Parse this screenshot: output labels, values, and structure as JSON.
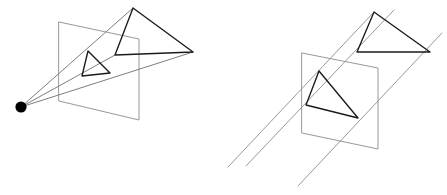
{
  "figure": {
    "width": 447,
    "height": 195,
    "background_color": "#ffffff",
    "title": "",
    "panels": [
      {
        "id": "perspective-projection",
        "name": "perspective-projection-diagram",
        "projection_type": "perspective",
        "description": "Perspective projection: rays converge at a single center of projection shown as a filled black dot, passing through an image plane onto a triangular object.",
        "center_of_projection": {
          "x": 21,
          "y": 107,
          "radius": 5.6,
          "color": "#000000"
        },
        "image_plane": {
          "name": "image-plane",
          "color": "#8c8c8c",
          "stroke_width": 0.9,
          "corners": [
            {
              "x": 59,
              "y": 22
            },
            {
              "x": 139,
              "y": 39
            },
            {
              "x": 139,
              "y": 120
            },
            {
              "x": 59,
              "y": 101
            }
          ]
        },
        "object_triangle": {
          "name": "object-triangle",
          "color": "#1a1a1a",
          "stroke_width": 1.35,
          "vertices": [
            {
              "x": 133,
              "y": 8
            },
            {
              "x": 193,
              "y": 52
            },
            {
              "x": 115,
              "y": 55
            }
          ]
        },
        "image_triangle": {
          "name": "projected-triangle",
          "color": "#1a1a1a",
          "stroke_width": 1.35,
          "vertices": [
            {
              "x": 88,
              "y": 51
            },
            {
              "x": 110,
              "y": 73
            },
            {
              "x": 82,
              "y": 76
            }
          ]
        },
        "projection_rays": {
          "name": "projection-rays",
          "color": "#6e6e6e",
          "stroke_width": 0.9,
          "lines": [
            {
              "x1": 21,
              "y1": 107,
              "x2": 133,
              "y2": 8
            },
            {
              "x1": 21,
              "y1": 107,
              "x2": 193,
              "y2": 52
            },
            {
              "x1": 21,
              "y1": 107,
              "x2": 115,
              "y2": 55
            }
          ]
        }
      },
      {
        "id": "parallel-projection",
        "name": "parallel-projection-diagram",
        "projection_type": "parallel",
        "description": "Parallel (orthographic) projection: rays travel in parallel, with no center of projection, through an image plane onto a triangular object.",
        "center_of_projection": null,
        "image_plane": {
          "name": "image-plane",
          "color": "#8c8c8c",
          "stroke_width": 0.9,
          "corners": [
            {
              "x": 302,
              "y": 53
            },
            {
              "x": 378,
              "y": 68
            },
            {
              "x": 378,
              "y": 149
            },
            {
              "x": 302,
              "y": 133
            }
          ]
        },
        "object_triangle": {
          "name": "object-triangle",
          "color": "#1a1a1a",
          "stroke_width": 1.35,
          "vertices": [
            {
              "x": 374,
              "y": 12
            },
            {
              "x": 430,
              "y": 52
            },
            {
              "x": 357,
              "y": 52
            }
          ]
        },
        "image_triangle": {
          "name": "projected-triangle",
          "color": "#1a1a1a",
          "stroke_width": 1.35,
          "vertices": [
            {
              "x": 319,
              "y": 71
            },
            {
              "x": 358,
              "y": 118
            },
            {
              "x": 306,
              "y": 105
            }
          ]
        },
        "projection_rays": {
          "name": "projection-rays",
          "color": "#8c8c8c",
          "stroke_width": 0.9,
          "lines": [
            {
              "x1": 228,
              "y1": 167,
              "x2": 374,
              "y2": 12
            },
            {
              "x1": 246,
              "y1": 166,
              "x2": 394,
              "y2": 10
            },
            {
              "x1": 298,
              "y1": 186,
              "x2": 442,
              "y2": 33
            }
          ]
        }
      }
    ]
  }
}
